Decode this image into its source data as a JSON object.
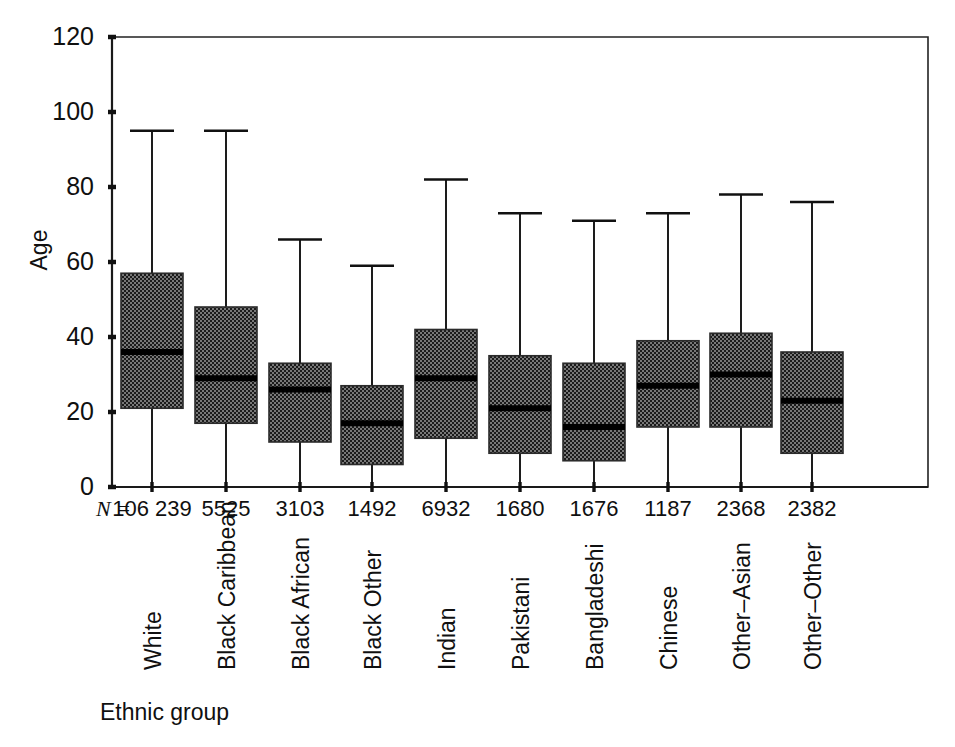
{
  "figure": {
    "background": "#ffffff",
    "ink_color": "#111111",
    "box_fill_dark": "#1c1c1c",
    "box_fill_light": "#6e6e6e"
  },
  "chart_data": {
    "type": "box",
    "title": "",
    "subtitle": "",
    "xlabel": "Ethnic group",
    "ylabel": "Age",
    "ylim": [
      0,
      120
    ],
    "yticks": [
      0,
      20,
      40,
      60,
      80,
      100,
      120
    ],
    "ytick_labels": [
      "0",
      "20",
      "40",
      "60",
      "80",
      "100",
      "120"
    ],
    "grid": false,
    "legend": "none",
    "n_row_label": "N =",
    "categories": [
      "White",
      "Black Caribbean",
      "Black African",
      "Black Other",
      "Indian",
      "Pakistani",
      "Bangladeshi",
      "Chinese",
      "Other–Asian",
      "Other–Other"
    ],
    "n_values": [
      "106 239",
      "5525",
      "3103",
      "1492",
      "6932",
      "1680",
      "1676",
      "1187",
      "2368",
      "2382"
    ],
    "series": [
      {
        "name": "Age distribution",
        "boxes": [
          {
            "category": "White",
            "whisker_low": 0,
            "q1": 21,
            "median": 36,
            "q3": 57,
            "whisker_high": 95
          },
          {
            "category": "Black Caribbean",
            "whisker_low": 0,
            "q1": 17,
            "median": 29,
            "q3": 48,
            "whisker_high": 95
          },
          {
            "category": "Black African",
            "whisker_low": 0,
            "q1": 12,
            "median": 26,
            "q3": 33,
            "whisker_high": 66
          },
          {
            "category": "Black Other",
            "whisker_low": 0,
            "q1": 6,
            "median": 17,
            "q3": 27,
            "whisker_high": 59
          },
          {
            "category": "Indian",
            "whisker_low": 0,
            "q1": 13,
            "median": 29,
            "q3": 42,
            "whisker_high": 82
          },
          {
            "category": "Pakistani",
            "whisker_low": 0,
            "q1": 9,
            "median": 21,
            "q3": 35,
            "whisker_high": 73
          },
          {
            "category": "Bangladeshi",
            "whisker_low": 0,
            "q1": 7,
            "median": 16,
            "q3": 33,
            "whisker_high": 71
          },
          {
            "category": "Chinese",
            "whisker_low": 0,
            "q1": 16,
            "median": 27,
            "q3": 39,
            "whisker_high": 73
          },
          {
            "category": "Other–Asian",
            "whisker_low": 0,
            "q1": 16,
            "median": 30,
            "q3": 41,
            "whisker_high": 78
          },
          {
            "category": "Other–Other",
            "whisker_low": 0,
            "q1": 9,
            "median": 23,
            "q3": 36,
            "whisker_high": 76
          }
        ]
      }
    ]
  }
}
